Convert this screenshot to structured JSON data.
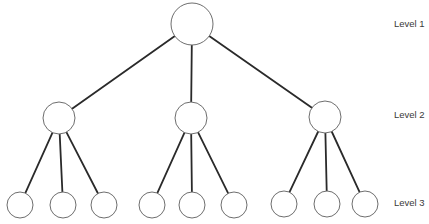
{
  "diagram": {
    "type": "tree-hierarchy",
    "levels": [
      {
        "label": "Level 1",
        "y": 24
      },
      {
        "label": "Level 2",
        "y": 118
      },
      {
        "label": "Level 3",
        "y": 205
      }
    ],
    "nodes": [
      {
        "id": "root",
        "level": 1,
        "cx": 192,
        "cy": 24,
        "r": 21
      },
      {
        "id": "l2-a",
        "level": 2,
        "cx": 59,
        "cy": 118,
        "r": 16,
        "parent": "root"
      },
      {
        "id": "l2-b",
        "level": 2,
        "cx": 191,
        "cy": 118,
        "r": 16,
        "parent": "root"
      },
      {
        "id": "l2-c",
        "level": 2,
        "cx": 325,
        "cy": 117,
        "r": 16,
        "parent": "root"
      },
      {
        "id": "l3-a1",
        "level": 3,
        "cx": 20,
        "cy": 205,
        "r": 13,
        "parent": "l2-a"
      },
      {
        "id": "l3-a2",
        "level": 3,
        "cx": 63,
        "cy": 205,
        "r": 13,
        "parent": "l2-a"
      },
      {
        "id": "l3-a3",
        "level": 3,
        "cx": 104,
        "cy": 205,
        "r": 13,
        "parent": "l2-a"
      },
      {
        "id": "l3-b1",
        "level": 3,
        "cx": 152,
        "cy": 205,
        "r": 13,
        "parent": "l2-b"
      },
      {
        "id": "l3-b2",
        "level": 3,
        "cx": 192,
        "cy": 205,
        "r": 13,
        "parent": "l2-b"
      },
      {
        "id": "l3-b3",
        "level": 3,
        "cx": 234,
        "cy": 205,
        "r": 13,
        "parent": "l2-b"
      },
      {
        "id": "l3-c1",
        "level": 3,
        "cx": 284,
        "cy": 204,
        "r": 13,
        "parent": "l2-c"
      },
      {
        "id": "l3-c2",
        "level": 3,
        "cx": 327,
        "cy": 204,
        "r": 13,
        "parent": "l2-c"
      },
      {
        "id": "l3-c3",
        "level": 3,
        "cx": 365,
        "cy": 204,
        "r": 13,
        "parent": "l2-c"
      }
    ],
    "colors": {
      "edge": "#2a2a2a",
      "node_stroke": "#6e6e6e",
      "node_fill": "#ffffff",
      "label": "#3a3a3a"
    }
  }
}
